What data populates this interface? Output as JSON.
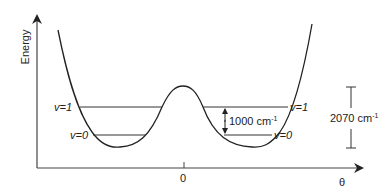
{
  "diagram": {
    "axes": {
      "y_label": "Energy",
      "x_label": "θ",
      "x_tick_label": "0"
    },
    "levels": {
      "left_v1": "v=1",
      "left_v0": "v=0",
      "right_v1": "v=1",
      "right_v0": "v=0"
    },
    "annotations": {
      "spacing_value": "1000 cm",
      "spacing_exp": "-1",
      "barrier_value": "2070 cm",
      "barrier_exp": "-1"
    },
    "colors": {
      "line": "#222222",
      "background": "#ffffff"
    }
  }
}
